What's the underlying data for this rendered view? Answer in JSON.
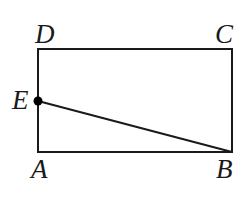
{
  "figure": {
    "kind": "plane-geometry-diagram",
    "shape_name": "rectangle",
    "background_color": "#ffffff",
    "stroke_color": "#1a1a1a",
    "point_color": "#000000",
    "stroke_width": 2,
    "labels": {
      "top_left": "D",
      "top_right": "C",
      "bottom_left": "A",
      "bottom_right": "B",
      "left_edge_point": "E"
    },
    "vertices": {
      "A": {
        "x": 38,
        "y": 152
      },
      "B": {
        "x": 232,
        "y": 152
      },
      "C": {
        "x": 232,
        "y": 49
      },
      "D": {
        "x": 38,
        "y": 49
      },
      "E": {
        "x": 38,
        "y": 101
      }
    },
    "segments": [
      {
        "name": "DC",
        "from": "D",
        "to": "C"
      },
      {
        "name": "CB",
        "from": "C",
        "to": "B"
      },
      {
        "name": "BA",
        "from": "B",
        "to": "A"
      },
      {
        "name": "AD",
        "from": "A",
        "to": "D"
      },
      {
        "name": "EB",
        "from": "E",
        "to": "B"
      }
    ],
    "marked_points": [
      {
        "label": "E",
        "x": 38,
        "y": 101,
        "radius": 4.5,
        "filled": true
      }
    ]
  }
}
